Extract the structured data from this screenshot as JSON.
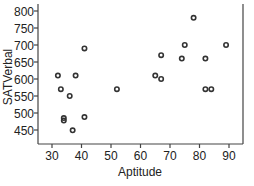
{
  "chart_data": {
    "type": "scatter",
    "title": "",
    "xlabel": "Aptitude",
    "ylabel": "SATVerbal",
    "xlim": [
      26,
      96
    ],
    "ylim": [
      425,
      820
    ],
    "xticks": [
      30,
      40,
      50,
      60,
      70,
      80,
      90
    ],
    "yticks": [
      450,
      500,
      550,
      600,
      650,
      700,
      750,
      800
    ],
    "grid": false,
    "legend": null,
    "marker": "open-circle",
    "color": "#333333",
    "points": [
      {
        "x": 32,
        "y": 610
      },
      {
        "x": 38,
        "y": 610
      },
      {
        "x": 33,
        "y": 570
      },
      {
        "x": 36,
        "y": 550
      },
      {
        "x": 34,
        "y": 485
      },
      {
        "x": 34,
        "y": 478
      },
      {
        "x": 41,
        "y": 488
      },
      {
        "x": 37,
        "y": 449
      },
      {
        "x": 41,
        "y": 690
      },
      {
        "x": 52,
        "y": 570
      },
      {
        "x": 65,
        "y": 610
      },
      {
        "x": 67,
        "y": 600
      },
      {
        "x": 67,
        "y": 670
      },
      {
        "x": 74,
        "y": 660
      },
      {
        "x": 75,
        "y": 700
      },
      {
        "x": 78,
        "y": 780
      },
      {
        "x": 82,
        "y": 660
      },
      {
        "x": 82,
        "y": 570
      },
      {
        "x": 84,
        "y": 570
      },
      {
        "x": 89,
        "y": 700
      }
    ]
  }
}
